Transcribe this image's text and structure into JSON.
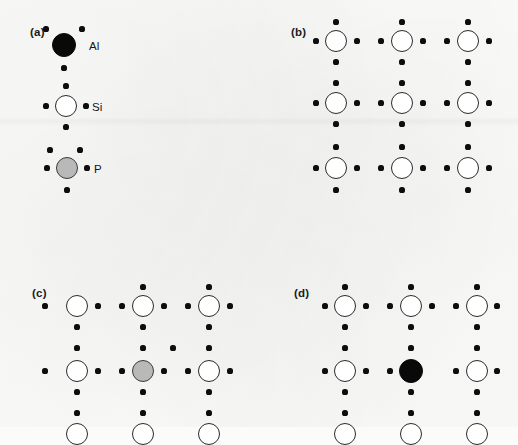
{
  "figure": {
    "background_color": "#fbfbfa",
    "ink_color": "#0d0d0d",
    "atom_colors": {
      "Al": "#090909",
      "Si": "#ffffff",
      "P": "#b9b9b9"
    },
    "atom_radius_px": 11,
    "electron_radius_px": 2.6,
    "lattice_spacing_px": 66
  },
  "panels": [
    {
      "id": "a",
      "label": "(a)",
      "label_pos": [
        30,
        26
      ],
      "caption": "Legend: individual atoms with valence electrons",
      "atoms": [
        {
          "species": "Al",
          "kind": "al",
          "label": "Al",
          "label_pos": [
            89,
            40
          ],
          "center": [
            64,
            45
          ],
          "radius": 12,
          "valence": 3,
          "electrons": [
            [
              46,
              29
            ],
            [
              82,
              29
            ],
            [
              64,
              68
            ]
          ]
        },
        {
          "species": "Si",
          "kind": "si",
          "label": "Si",
          "label_pos": [
            92,
            101
          ],
          "center": [
            66,
            106
          ],
          "radius": 11,
          "valence": 4,
          "electrons": [
            [
              66,
              86
            ],
            [
              46,
              106
            ],
            [
              86,
              106
            ],
            [
              66,
              127
            ]
          ]
        },
        {
          "species": "P",
          "kind": "p",
          "label": "P",
          "label_pos": [
            94,
            163
          ],
          "center": [
            67,
            168
          ],
          "radius": 11,
          "valence": 5,
          "electrons": [
            [
              50,
              150
            ],
            [
              80,
              150
            ],
            [
              47,
              168
            ],
            [
              87,
              168
            ],
            [
              67,
              190
            ]
          ]
        }
      ]
    },
    {
      "id": "b",
      "label": "(b)",
      "label_pos": [
        291,
        26
      ],
      "caption": "Intrinsic silicon lattice: every Si shares four bonding electron pairs",
      "atoms": [
        {
          "species": "Si",
          "kind": "si",
          "center": [
            336,
            41
          ],
          "radius": 11
        },
        {
          "species": "Si",
          "kind": "si",
          "center": [
            402,
            41
          ],
          "radius": 11
        },
        {
          "species": "Si",
          "kind": "si",
          "center": [
            468,
            41
          ],
          "radius": 11
        },
        {
          "species": "Si",
          "kind": "si",
          "center": [
            336,
            103
          ],
          "radius": 11
        },
        {
          "species": "Si",
          "kind": "si",
          "center": [
            402,
            103
          ],
          "radius": 11
        },
        {
          "species": "Si",
          "kind": "si",
          "center": [
            468,
            103
          ],
          "radius": 11
        },
        {
          "species": "Si",
          "kind": "si",
          "center": [
            336,
            168
          ],
          "radius": 11
        },
        {
          "species": "Si",
          "kind": "si",
          "center": [
            402,
            168
          ],
          "radius": 11
        },
        {
          "species": "Si",
          "kind": "si",
          "center": [
            468,
            168
          ],
          "radius": 11
        }
      ],
      "electrons": [
        [
          336,
          22
        ],
        [
          402,
          22
        ],
        [
          468,
          22
        ],
        [
          316,
          41
        ],
        [
          357,
          41
        ],
        [
          381,
          41
        ],
        [
          423,
          41
        ],
        [
          447,
          41
        ],
        [
          489,
          41
        ],
        [
          336,
          62
        ],
        [
          402,
          62
        ],
        [
          468,
          62
        ],
        [
          336,
          83
        ],
        [
          402,
          83
        ],
        [
          468,
          83
        ],
        [
          316,
          103
        ],
        [
          357,
          103
        ],
        [
          381,
          103
        ],
        [
          423,
          103
        ],
        [
          447,
          103
        ],
        [
          489,
          103
        ],
        [
          336,
          124
        ],
        [
          402,
          124
        ],
        [
          468,
          124
        ],
        [
          336,
          147
        ],
        [
          402,
          147
        ],
        [
          468,
          147
        ],
        [
          316,
          168
        ],
        [
          357,
          168
        ],
        [
          381,
          168
        ],
        [
          423,
          168
        ],
        [
          447,
          168
        ],
        [
          489,
          168
        ],
        [
          336,
          190
        ],
        [
          402,
          190
        ],
        [
          468,
          190
        ]
      ]
    },
    {
      "id": "c",
      "label": "(c)",
      "label_pos": [
        32,
        287
      ],
      "caption": "n-type: phosphorus donor contributes one extra free electron",
      "atoms": [
        {
          "species": "Si",
          "kind": "si",
          "center": [
            77,
            306
          ],
          "radius": 11
        },
        {
          "species": "Si",
          "kind": "si",
          "center": [
            143,
            306
          ],
          "radius": 11
        },
        {
          "species": "Si",
          "kind": "si",
          "center": [
            209,
            306
          ],
          "radius": 11
        },
        {
          "species": "Si",
          "kind": "si",
          "center": [
            77,
            371
          ],
          "radius": 11
        },
        {
          "species": "P",
          "kind": "p",
          "center": [
            143,
            371
          ],
          "radius": 11
        },
        {
          "species": "Si",
          "kind": "si",
          "center": [
            209,
            371
          ],
          "radius": 11
        },
        {
          "species": "Si",
          "kind": "si",
          "center": [
            77,
            434
          ],
          "radius": 11
        },
        {
          "species": "Si",
          "kind": "si",
          "center": [
            143,
            434
          ],
          "radius": 11
        },
        {
          "species": "Si",
          "kind": "si",
          "center": [
            209,
            434
          ],
          "radius": 11
        }
      ],
      "electrons": [
        [
          143,
          287
        ],
        [
          209,
          287
        ],
        [
          45,
          306
        ],
        [
          98,
          306
        ],
        [
          122,
          306
        ],
        [
          164,
          306
        ],
        [
          188,
          306
        ],
        [
          230,
          306
        ],
        [
          77,
          327
        ],
        [
          143,
          327
        ],
        [
          209,
          327
        ],
        [
          77,
          348
        ],
        [
          143,
          348
        ],
        [
          173,
          348
        ],
        [
          209,
          348
        ],
        [
          45,
          371
        ],
        [
          98,
          371
        ],
        [
          122,
          371
        ],
        [
          164,
          371
        ],
        [
          188,
          371
        ],
        [
          230,
          371
        ],
        [
          77,
          392
        ],
        [
          143,
          392
        ],
        [
          209,
          392
        ],
        [
          77,
          413
        ],
        [
          143,
          413
        ],
        [
          209,
          413
        ]
      ],
      "extra_electron": [
        173,
        348
      ]
    },
    {
      "id": "d",
      "label": "(d)",
      "label_pos": [
        294,
        287
      ],
      "caption": "p-type: aluminium acceptor leaves an unfilled bond (hole)",
      "atoms": [
        {
          "species": "Si",
          "kind": "si",
          "center": [
            345,
            306
          ],
          "radius": 11
        },
        {
          "species": "Si",
          "kind": "si",
          "center": [
            411,
            306
          ],
          "radius": 11
        },
        {
          "species": "Si",
          "kind": "si",
          "center": [
            477,
            306
          ],
          "radius": 11
        },
        {
          "species": "Si",
          "kind": "si",
          "center": [
            345,
            371
          ],
          "radius": 11
        },
        {
          "species": "Al",
          "kind": "al",
          "center": [
            411,
            371
          ],
          "radius": 12
        },
        {
          "species": "Si",
          "kind": "si",
          "center": [
            477,
            371
          ],
          "radius": 11
        },
        {
          "species": "Si",
          "kind": "si",
          "center": [
            345,
            434
          ],
          "radius": 11
        },
        {
          "species": "Si",
          "kind": "si",
          "center": [
            411,
            434
          ],
          "radius": 11
        },
        {
          "species": "Si",
          "kind": "si",
          "center": [
            477,
            434
          ],
          "radius": 11
        }
      ],
      "electrons": [
        [
          345,
          287
        ],
        [
          411,
          287
        ],
        [
          477,
          287
        ],
        [
          325,
          306
        ],
        [
          366,
          306
        ],
        [
          390,
          306
        ],
        [
          432,
          306
        ],
        [
          456,
          306
        ],
        [
          497,
          306
        ],
        [
          345,
          327
        ],
        [
          411,
          327
        ],
        [
          477,
          327
        ],
        [
          345,
          348
        ],
        [
          411,
          348
        ],
        [
          477,
          348
        ],
        [
          325,
          371
        ],
        [
          366,
          371
        ],
        [
          390,
          371
        ],
        [
          456,
          371
        ],
        [
          497,
          371
        ],
        [
          345,
          392
        ],
        [
          411,
          392
        ],
        [
          477,
          392
        ],
        [
          345,
          413
        ],
        [
          411,
          413
        ],
        [
          477,
          413
        ]
      ],
      "missing_electron": [
        432,
        371
      ]
    }
  ]
}
